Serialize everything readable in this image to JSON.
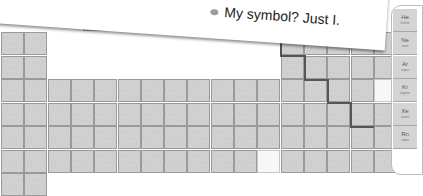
{
  "callout": {
    "text": "My symbol? Just I.",
    "bullet_color": "#9e9e9e"
  },
  "noble_gases": [
    {
      "symbol": "He",
      "name": "helium"
    },
    {
      "symbol": "Ne",
      "name": "neon"
    },
    {
      "symbol": "Ar",
      "name": "argon"
    },
    {
      "symbol": "Kr",
      "name": "krypton"
    },
    {
      "symbol": "Xe",
      "name": "xenon"
    },
    {
      "symbol": "Rn",
      "name": "radon"
    }
  ],
  "colors": {
    "cell_fill": "#cfcfcf",
    "cell_border": "#9a9a9a",
    "highlight_blank": "#f7f7f7",
    "staircase_line": "#555555"
  }
}
